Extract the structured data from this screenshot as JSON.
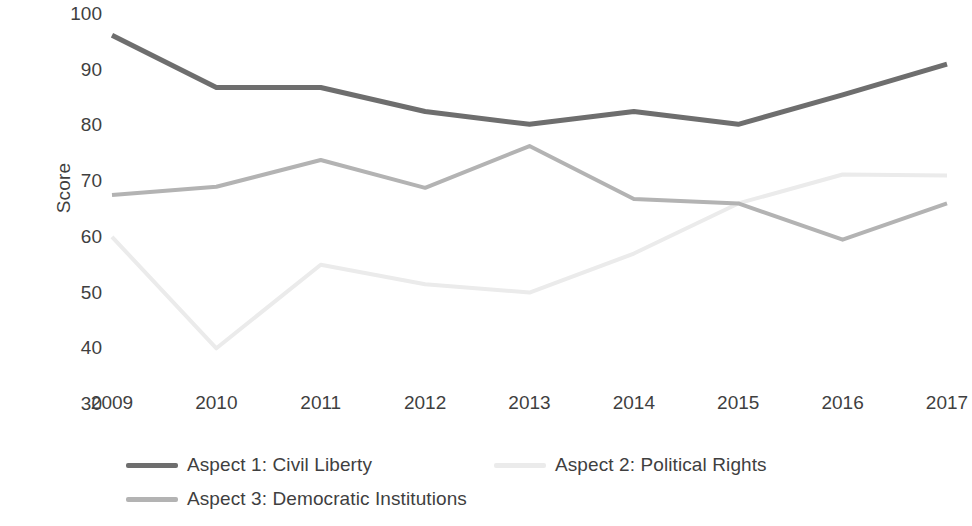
{
  "chart_data": {
    "type": "line",
    "title": "",
    "xlabel": "",
    "ylabel": "Score",
    "categories": [
      "2009",
      "2010",
      "2011",
      "2012",
      "2013",
      "2014",
      "2015",
      "2016",
      "2017"
    ],
    "ylim": [
      30,
      100
    ],
    "ytick_values": [
      100,
      90,
      80,
      70,
      60,
      50,
      40,
      30
    ],
    "ytick_labels": [
      "100",
      "90",
      "80",
      "70",
      "60",
      "50",
      "40",
      "30"
    ],
    "grid": false,
    "legend_position": "bottom",
    "series": [
      {
        "name": "Aspect 1: Civil Liberty",
        "color": "#6e6e6e",
        "width": 5,
        "values": [
          96.2,
          86.8,
          86.8,
          82.5,
          80.2,
          82.5,
          80.2,
          85.5,
          91.0
        ]
      },
      {
        "name": "Aspect 2: Political Rights",
        "color": "#ebebeb",
        "width": 4,
        "values": [
          60.0,
          40.0,
          55.0,
          51.5,
          50.0,
          57.0,
          66.0,
          71.2,
          71.0
        ]
      },
      {
        "name": "Aspect 3: Democratic Institutions",
        "color": "#b3b3b3",
        "width": 4,
        "values": [
          67.5,
          69.0,
          73.8,
          68.8,
          76.3,
          66.8,
          66.0,
          59.5,
          66.0
        ]
      }
    ]
  },
  "axis": {
    "y_title": "Score"
  },
  "legend": {
    "items": [
      {
        "label": "Aspect 1: Civil Liberty",
        "color": "#6e6e6e"
      },
      {
        "label": "Aspect 2: Political Rights",
        "color": "#ebebeb"
      },
      {
        "label": "Aspect 3: Democratic Institutions",
        "color": "#b3b3b3"
      }
    ]
  }
}
